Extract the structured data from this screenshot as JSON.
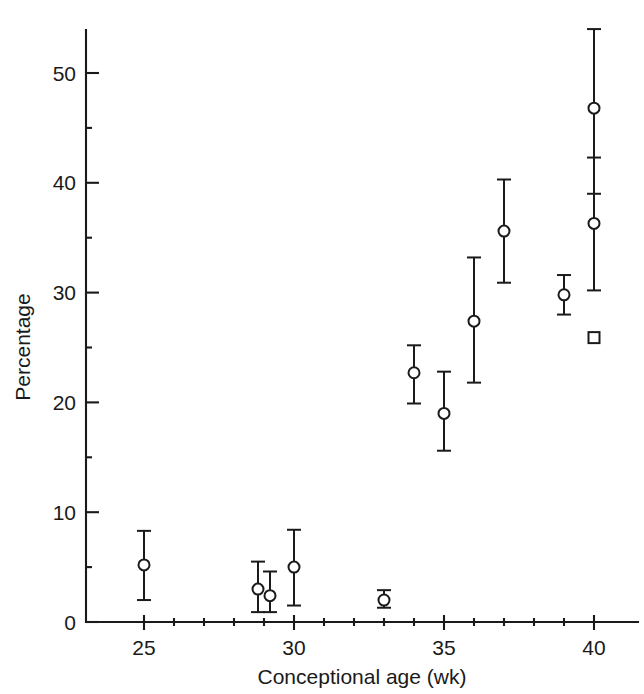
{
  "chart_data": {
    "type": "scatter",
    "title": "",
    "xlabel": "Conceptional age (wk)",
    "ylabel": "Percentage",
    "xlim": [
      24.2,
      40.9
    ],
    "ylim": [
      0,
      54
    ],
    "grid": false,
    "legend": null,
    "x_ticks_major": [
      25,
      30,
      35,
      40
    ],
    "x_tick_labels": [
      "25",
      "30",
      "35",
      "40"
    ],
    "x_ticks_minor": [
      26,
      27,
      28,
      29,
      31,
      32,
      33,
      34,
      36,
      37,
      38,
      39
    ],
    "y_ticks_major": [
      0,
      10,
      20,
      30,
      40,
      50
    ],
    "y_tick_labels": [
      "0",
      "10",
      "20",
      "30",
      "40",
      "50"
    ],
    "y_ticks_minor": [
      5,
      15,
      25,
      35,
      45
    ],
    "error_bar_type": "vertical",
    "points": [
      {
        "id": "p25",
        "x": 25.0,
        "y": 5.2,
        "y_low": 2.0,
        "y_high": 8.3,
        "marker": "circle"
      },
      {
        "id": "p28_8",
        "x": 28.8,
        "y": 3.0,
        "y_low": 0.9,
        "y_high": 5.5,
        "marker": "circle"
      },
      {
        "id": "p29_2",
        "x": 29.2,
        "y": 2.4,
        "y_low": 0.9,
        "y_high": 4.6,
        "marker": "circle"
      },
      {
        "id": "p30",
        "x": 30.0,
        "y": 5.0,
        "y_low": 1.5,
        "y_high": 8.4,
        "marker": "circle"
      },
      {
        "id": "p33",
        "x": 33.0,
        "y": 2.0,
        "y_low": 1.3,
        "y_high": 2.9,
        "marker": "circle"
      },
      {
        "id": "p34",
        "x": 34.0,
        "y": 22.7,
        "y_low": 19.9,
        "y_high": 25.2,
        "marker": "circle"
      },
      {
        "id": "p35",
        "x": 35.0,
        "y": 19.0,
        "y_low": 15.6,
        "y_high": 22.8,
        "marker": "circle"
      },
      {
        "id": "p36",
        "x": 36.0,
        "y": 27.4,
        "y_low": 21.8,
        "y_high": 33.2,
        "marker": "circle"
      },
      {
        "id": "p37",
        "x": 37.0,
        "y": 35.6,
        "y_low": 30.9,
        "y_high": 40.3,
        "marker": "circle"
      },
      {
        "id": "p39",
        "x": 39.0,
        "y": 29.8,
        "y_low": 28.0,
        "y_high": 31.6,
        "marker": "circle"
      },
      {
        "id": "p40a",
        "x": 40.0,
        "y": 46.8,
        "y_low": 39.0,
        "y_high": 54.0,
        "marker": "circle"
      },
      {
        "id": "p40b",
        "x": 40.0,
        "y": 36.3,
        "y_low": 30.2,
        "y_high": 42.3,
        "marker": "circle"
      },
      {
        "id": "p40c",
        "x": 40.0,
        "y": 25.9,
        "y_low": 25.9,
        "y_high": 25.9,
        "marker": "square"
      }
    ]
  },
  "colors": {
    "ink": "#1a1a1a",
    "background": "#ffffff",
    "marker_fill": "#ffffff"
  }
}
